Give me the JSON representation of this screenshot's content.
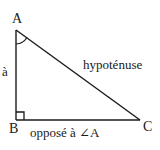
{
  "figure": {
    "kind": "right-triangle-diagram",
    "language": "fr",
    "background_color": "#ffffff",
    "stroke_color": "#1a1a1a",
    "vertices": {
      "A": {
        "label": "A",
        "x": 16,
        "y": 30
      },
      "B": {
        "label": "B",
        "x": 16,
        "y": 120
      },
      "C": {
        "label": "C",
        "x": 140,
        "y": 120
      }
    },
    "markers": {
      "right_angle_at": "B",
      "angle_arc_at": "A"
    },
    "labels": {
      "leg_ab": "à",
      "hypotenuse": "hypoténuse",
      "side_bc": "opposé à ∠A"
    }
  }
}
